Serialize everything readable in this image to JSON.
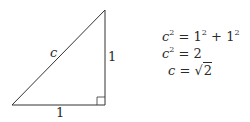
{
  "diagram": {
    "type": "right-triangle",
    "hypotenuse_label": "c",
    "vertical_leg_label": "1",
    "horizontal_leg_label": "1",
    "right_angle_marker": true
  },
  "equations": [
    {
      "lhs_base": "c",
      "lhs_exp": "2",
      "op": "=",
      "t1": "1",
      "t1_exp": "2",
      "plus": "+",
      "t2": "1",
      "t2_exp": "2"
    },
    {
      "lhs_base": "c",
      "lhs_exp": "2",
      "op": "=",
      "rhs": "2"
    },
    {
      "lhs_base": "c",
      "op": "=",
      "sqrt_symbol": "√",
      "radicand": "2"
    }
  ]
}
